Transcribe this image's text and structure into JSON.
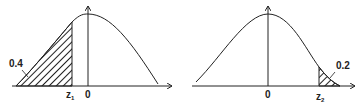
{
  "panels": [
    {
      "id": "left",
      "area_label": "0.4",
      "z_label": "z",
      "z_sub": "1",
      "origin_label": "0",
      "shaded_region": "left tail up to z1"
    },
    {
      "id": "right",
      "area_label": "0.2",
      "z_label": "z",
      "z_sub": "2",
      "origin_label": "0",
      "shaded_region": "right tail beyond z2"
    }
  ],
  "colors": {
    "line": "#222222",
    "background": "#ffffff"
  }
}
